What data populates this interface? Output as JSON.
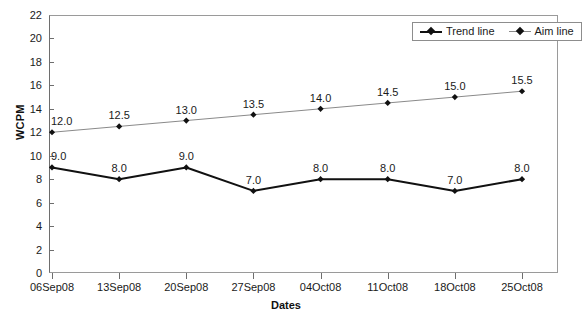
{
  "chart_data": {
    "type": "line",
    "title": "",
    "xlabel": "Dates",
    "ylabel": "WCPM",
    "categories": [
      "06Sep08",
      "13Sep08",
      "20Sep08",
      "27Sep08",
      "04Oct08",
      "11Oct08",
      "18Oct08",
      "25Oct08"
    ],
    "series": [
      {
        "name": "Trend line",
        "values": [
          9.0,
          8.0,
          9.0,
          7.0,
          8.0,
          8.0,
          7.0,
          8.0
        ],
        "labels": [
          "9.0",
          "8.0",
          "9.0",
          "7.0",
          "8.0",
          "8.0",
          "7.0",
          "8.0"
        ],
        "color": "#111111",
        "marker": "diamond",
        "line_width": 2
      },
      {
        "name": "Aim line",
        "values": [
          12.0,
          12.5,
          13.0,
          13.5,
          14.0,
          14.5,
          15.0,
          15.5
        ],
        "labels": [
          "12.0",
          "12.5",
          "13.0",
          "13.5",
          "14.0",
          "14.5",
          "15.0",
          "15.5"
        ],
        "color": "#8a8a8a",
        "marker": "diamond",
        "line_width": 1
      }
    ],
    "ylim": [
      0,
      22
    ],
    "ytick_step": 2,
    "yticks": [
      "0",
      "2",
      "4",
      "6",
      "8",
      "10",
      "12",
      "14",
      "16",
      "18",
      "20",
      "22"
    ],
    "grid": false,
    "legend_position": "top-right",
    "legend_entries": [
      "Trend line",
      "Aim line"
    ]
  },
  "axes": {
    "y_title": "WCPM",
    "x_title": "Dates",
    "y_tick_labels": [
      "22",
      "20",
      "18",
      "16",
      "14",
      "12",
      "10",
      "8",
      "6",
      "4",
      "2",
      "0"
    ],
    "x_tick_labels": [
      "06Sep08",
      "13Sep08",
      "20Sep08",
      "27Sep08",
      "04Oct08",
      "11Oct08",
      "18Oct08",
      "25Oct08"
    ]
  },
  "legend": {
    "items": [
      {
        "label": "Trend line",
        "key": "trend-line-key"
      },
      {
        "label": "Aim line",
        "key": "aim-line-key"
      }
    ]
  },
  "colors": {
    "trend_line": "#111111",
    "aim_line": "#8a8a8a",
    "axis": "#6e6e6e",
    "text": "#1a1a1a",
    "background": "#ffffff"
  }
}
